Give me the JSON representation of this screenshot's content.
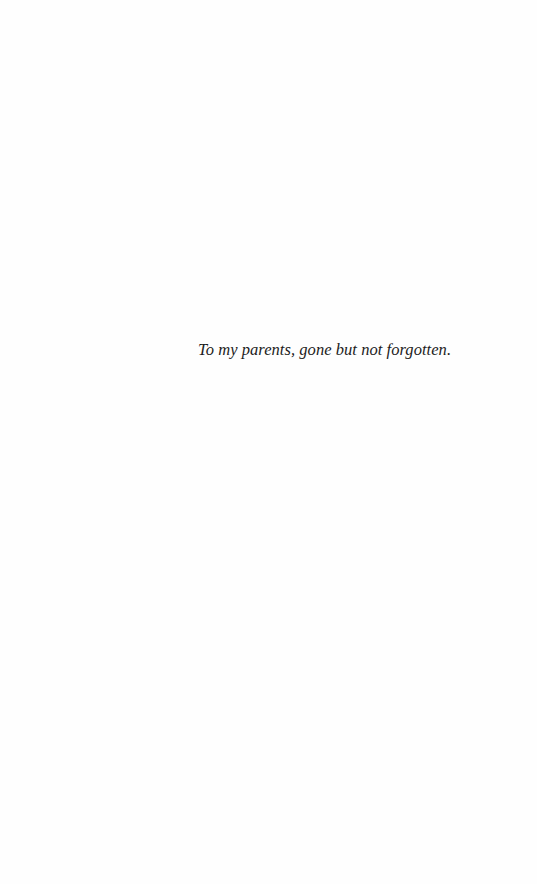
{
  "page": {
    "type": "dedication",
    "background": "#fefefe",
    "text_color": "#1c1c1c"
  },
  "dedication": {
    "text": "To my parents, gone but not forgotten."
  }
}
